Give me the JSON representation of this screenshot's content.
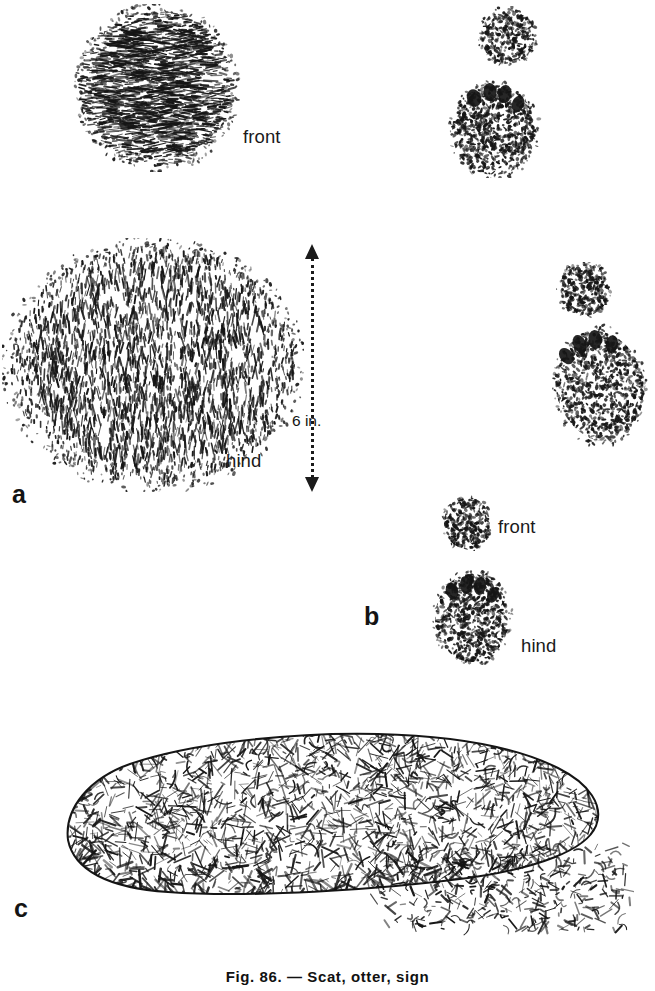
{
  "figure": {
    "caption": "Fig. 86. — Scat, otter, sign",
    "background_color": "#ffffff",
    "ink_color": "#141414"
  },
  "panels": [
    {
      "id": "a",
      "label": "a",
      "label_position": {
        "x": 12,
        "y": 482
      },
      "tracks": [
        {
          "name": "bear-front-track-large",
          "label": "front",
          "label_position": {
            "x": 243,
            "y": 128
          },
          "shape": "oval",
          "box": {
            "x": 72,
            "y": 4,
            "w": 170,
            "h": 168
          },
          "texture": "dense-horizontal-hatch"
        },
        {
          "name": "bear-hind-track-large",
          "label": "hind",
          "label_position": {
            "x": 226,
            "y": 452
          },
          "shape": "round-pad",
          "box": {
            "x": 2,
            "y": 238,
            "w": 300,
            "h": 252
          },
          "texture": "dense-vertical-hatch"
        },
        {
          "name": "bear-front-track-small",
          "label": "",
          "shape": "small-oval",
          "box": {
            "x": 478,
            "y": 6,
            "w": 58,
            "h": 58
          },
          "texture": "stipple"
        },
        {
          "name": "bear-hind-track-small",
          "label": "",
          "shape": "toed-pad",
          "box": {
            "x": 447,
            "y": 74,
            "w": 93,
            "h": 102
          },
          "texture": "stipple-with-toes"
        },
        {
          "name": "bear-front-track-small-2",
          "label": "",
          "shape": "small-oval",
          "box": {
            "x": 556,
            "y": 262,
            "w": 54,
            "h": 54
          },
          "texture": "stipple"
        },
        {
          "name": "bear-hind-track-small-2",
          "label": "",
          "shape": "toed-pad-angled",
          "box": {
            "x": 548,
            "y": 318,
            "w": 102,
            "h": 128
          },
          "texture": "stipple-with-toes"
        }
      ],
      "scale": {
        "name": "scale-bar",
        "text": "6 in.",
        "orientation": "vertical",
        "arrow_both_ends": true,
        "line_style": "dotted",
        "box": {
          "x": 300,
          "y": 244,
          "w": 24,
          "h": 248
        },
        "text_position": {
          "x": 292,
          "y": 412
        }
      }
    },
    {
      "id": "b",
      "label": "b",
      "label_position": {
        "x": 364,
        "y": 604
      },
      "tracks": [
        {
          "name": "raccoon-front-track",
          "label": "front",
          "label_position": {
            "x": 498,
            "y": 518
          },
          "shape": "small-oval",
          "box": {
            "x": 441,
            "y": 495,
            "w": 50,
            "h": 54
          },
          "texture": "stipple"
        },
        {
          "name": "raccoon-hind-track",
          "label": "hind",
          "label_position": {
            "x": 521,
            "y": 637
          },
          "shape": "toed-pad",
          "box": {
            "x": 430,
            "y": 565,
            "w": 82,
            "h": 98
          },
          "texture": "stipple-with-toes"
        }
      ]
    },
    {
      "id": "c",
      "label": "c",
      "label_position": {
        "x": 14,
        "y": 896
      },
      "drawing": {
        "name": "scat-drawing",
        "description": "elongated scat with scattered debris",
        "box": {
          "x": 38,
          "y": 724,
          "w": 590,
          "h": 212
        },
        "texture": "coarse-tangled-hatch"
      }
    }
  ]
}
